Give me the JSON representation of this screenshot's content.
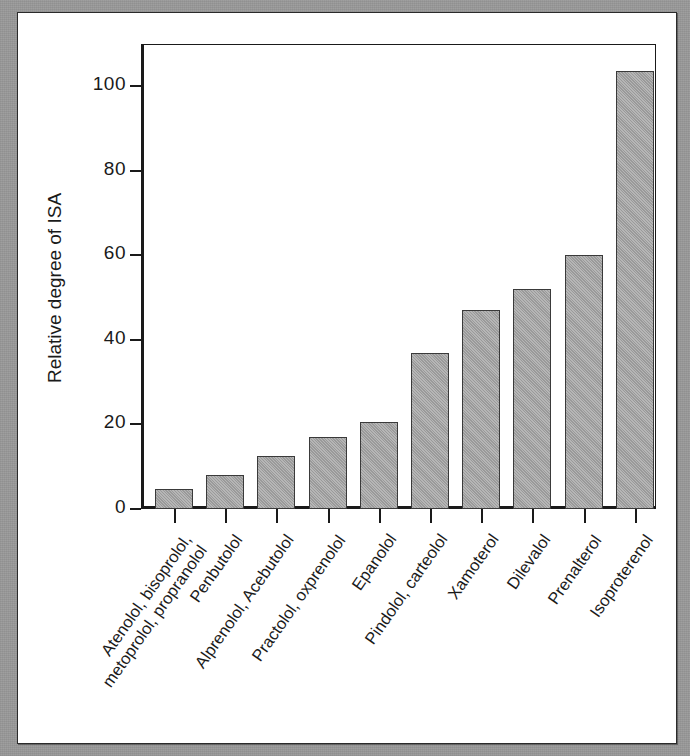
{
  "figure": {
    "background_color": "#969696",
    "card_color": "#ffffff",
    "bar_color": "#a2a2a2",
    "axis_color": "#1a1a1a"
  },
  "chart_data": {
    "type": "bar",
    "title": "",
    "xlabel": "",
    "ylabel": "Relative degree of ISA",
    "ylim": [
      0,
      110
    ],
    "yticks": [
      0,
      20,
      40,
      60,
      80,
      100
    ],
    "ytick_labels": [
      "0",
      "20",
      "40",
      "60",
      "80",
      "100"
    ],
    "grid": false,
    "legend": null,
    "categories": [
      "Atenolol, bisoprolol,\nmetoprolol, propranolol",
      "Penbutolol",
      "Alprenolol, Acebutolol",
      "Practolol, oxprenolol",
      "Epanolol",
      "Pindolol, carteolol",
      "Xamoterol",
      "Dilevalol",
      "Prenalterol",
      "Isoproterenol"
    ],
    "category_lines": [
      [
        "Atenolol, bisoprolol,",
        "metoprolol, propranolol"
      ],
      [
        "Penbutolol"
      ],
      [
        "Alprenolol, Acebutolol"
      ],
      [
        "Practolol, oxprenolol"
      ],
      [
        "Epanolol"
      ],
      [
        "Pindolol, carteolol"
      ],
      [
        "Xamoterol"
      ],
      [
        "Dilevalol"
      ],
      [
        "Prenalterol"
      ],
      [
        "Isoproterenol"
      ]
    ],
    "values": [
      4.8,
      8.0,
      12.5,
      17.0,
      20.5,
      37.0,
      47.0,
      52.0,
      60.0,
      103.5
    ]
  }
}
